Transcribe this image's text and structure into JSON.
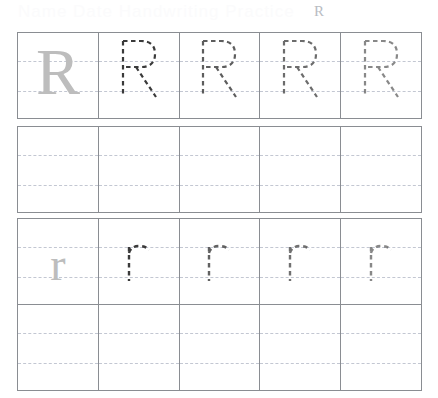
{
  "worksheet": {
    "title": "Letter R Handwriting Practice Worksheet",
    "header": {
      "ghost_text": "Name Date Handwriting Practice",
      "letter_label": "R"
    },
    "letters": {
      "uppercase": "R",
      "lowercase": "r"
    },
    "colors": {
      "grid_border": "#8a8d92",
      "guide_line": "#c3c7d2",
      "solid_letter": "#bdbdbd",
      "trace_letter": "#3a3a3a",
      "page_background": "#ffffff"
    },
    "layout": {
      "columns": 5,
      "rows": 4,
      "guide_lines_per_cell": 2
    },
    "rows": [
      {
        "index": 1,
        "name": "uppercase-model-row",
        "letter": "R",
        "case": "uppercase",
        "cells": [
          {
            "style": "solid",
            "letter": "R",
            "opacity": 1.0
          },
          {
            "style": "traced",
            "letter": "R",
            "opacity": 1.0
          },
          {
            "style": "traced",
            "letter": "R",
            "opacity": 0.82
          },
          {
            "style": "traced",
            "letter": "R",
            "opacity": 0.74
          },
          {
            "style": "traced",
            "letter": "R",
            "opacity": 0.6
          }
        ]
      },
      {
        "index": 2,
        "name": "uppercase-practice-row",
        "letter": "",
        "case": "uppercase",
        "cells": [
          {
            "style": "blank",
            "letter": "",
            "opacity": 0
          },
          {
            "style": "blank",
            "letter": "",
            "opacity": 0
          },
          {
            "style": "blank",
            "letter": "",
            "opacity": 0
          },
          {
            "style": "blank",
            "letter": "",
            "opacity": 0
          },
          {
            "style": "blank",
            "letter": "",
            "opacity": 0
          }
        ]
      },
      {
        "index": 3,
        "name": "lowercase-model-row",
        "letter": "r",
        "case": "lowercase",
        "cells": [
          {
            "style": "solid",
            "letter": "r",
            "opacity": 1.0
          },
          {
            "style": "traced",
            "letter": "r",
            "opacity": 1.0
          },
          {
            "style": "traced",
            "letter": "r",
            "opacity": 0.8
          },
          {
            "style": "traced",
            "letter": "r",
            "opacity": 0.72
          },
          {
            "style": "traced",
            "letter": "r",
            "opacity": 0.6
          }
        ]
      },
      {
        "index": 4,
        "name": "lowercase-practice-row",
        "letter": "",
        "case": "lowercase",
        "cells": [
          {
            "style": "blank",
            "letter": "",
            "opacity": 0
          },
          {
            "style": "blank",
            "letter": "",
            "opacity": 0
          },
          {
            "style": "blank",
            "letter": "",
            "opacity": 0
          },
          {
            "style": "blank",
            "letter": "",
            "opacity": 0
          },
          {
            "style": "blank",
            "letter": "",
            "opacity": 0
          }
        ]
      }
    ]
  }
}
